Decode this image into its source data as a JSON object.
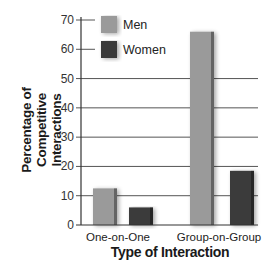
{
  "chart_data": {
    "type": "bar",
    "title": "",
    "xlabel": "Type of Interaction",
    "ylabel": "Percentage of Competitive Interactions",
    "ylabel_lines": [
      "Percentage of",
      "Competitive Interactions"
    ],
    "categories": [
      "One-on-One",
      "Group-on-Group"
    ],
    "series": [
      {
        "name": "Men",
        "values": [
          12.5,
          66
        ],
        "color": "#9a9a9a"
      },
      {
        "name": "Women",
        "values": [
          6,
          18.5
        ],
        "color": "#3a3a3a"
      }
    ],
    "ylim": [
      0,
      70
    ],
    "yticks": [
      0,
      10,
      20,
      30,
      40,
      50,
      60,
      70
    ],
    "grid": true,
    "legend_position": "upper-left"
  }
}
